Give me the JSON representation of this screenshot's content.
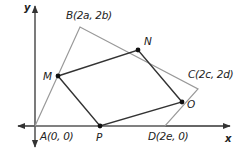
{
  "diagram": {
    "type": "coordinate-geometry",
    "axes": {
      "x_label": "x",
      "y_label": "y",
      "color": "#333333"
    },
    "outer_quadrilateral": {
      "color": "#999999",
      "vertices": [
        {
          "id": "A",
          "label": "A(0, 0)",
          "px": [
            35,
            126
          ]
        },
        {
          "id": "B",
          "label": "B(2a, 2b)",
          "px": [
            80,
            27
          ]
        },
        {
          "id": "C",
          "label": "C(2c, 2d)",
          "px": [
            198,
            89
          ]
        },
        {
          "id": "D",
          "label": "D(2e, 0)",
          "px": [
            165,
            126
          ]
        }
      ]
    },
    "midpoint_quadrilateral": {
      "color": "#333333",
      "vertices": [
        {
          "id": "M",
          "label": "M",
          "px": [
            58,
            76
          ]
        },
        {
          "id": "N",
          "label": "N",
          "px": [
            138,
            50
          ]
        },
        {
          "id": "O",
          "label": "O",
          "px": [
            182,
            102
          ]
        },
        {
          "id": "P",
          "label": "P",
          "px": [
            100,
            126
          ]
        }
      ]
    }
  }
}
